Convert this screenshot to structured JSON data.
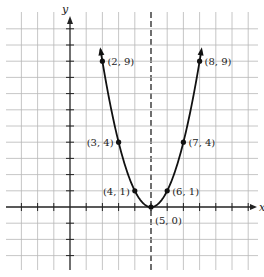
{
  "chart_data": {
    "type": "line",
    "title": "",
    "function": "y = (x - 5)^2",
    "xlabel": "x",
    "ylabel": "y",
    "grid": true,
    "xlim": [
      -3,
      11
    ],
    "ylim": [
      -3,
      11
    ],
    "axis_of_symmetry": 5,
    "points": [
      {
        "x": 2,
        "y": 9,
        "label": "(2, 9)"
      },
      {
        "x": 3,
        "y": 4,
        "label": "(3, 4)"
      },
      {
        "x": 4,
        "y": 1,
        "label": "(4, 1)"
      },
      {
        "x": 5,
        "y": 0,
        "label": "(5, 0)"
      },
      {
        "x": 6,
        "y": 1,
        "label": "(6, 1)"
      },
      {
        "x": 7,
        "y": 4,
        "label": "(7, 4)"
      },
      {
        "x": 8,
        "y": 9,
        "label": "(8, 9)"
      }
    ]
  },
  "colors": {
    "grid": "#b8b8b8",
    "axis": "#222222",
    "curve": "#111111"
  }
}
